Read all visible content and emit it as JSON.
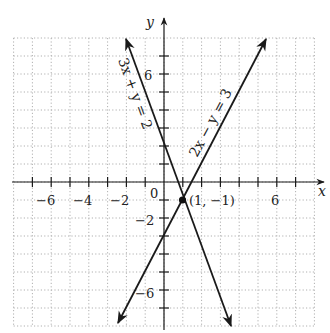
{
  "chart_data": {
    "type": "line",
    "title": "",
    "xlabel": "x",
    "ylabel": "y",
    "xlim": [
      -8,
      8
    ],
    "ylim": [
      -8,
      8
    ],
    "grid": true,
    "grid_style": "dotted",
    "x_ticks": [
      -6,
      -4,
      -2,
      0,
      2,
      4,
      6
    ],
    "x_tick_labels": [
      "−6",
      "−4",
      "−2",
      "0",
      "6"
    ],
    "y_tick_labels": [
      "6",
      "−2",
      "−6"
    ],
    "origin_label": "0",
    "series": [
      {
        "name": "3x + y = 2",
        "equation": "y = 2 - 3x",
        "x": [
          -2,
          3.27
        ],
        "y": [
          8,
          -7.8
        ]
      },
      {
        "name": "2x − y = 3",
        "equation": "y = 2x - 3",
        "x": [
          -2.4,
          5.5
        ],
        "y": [
          -7.8,
          8
        ]
      }
    ],
    "annotations": [
      {
        "text": "(1, −1)",
        "point": [
          1,
          -1
        ],
        "type": "intersection"
      }
    ]
  },
  "labels": {
    "x_axis": "x",
    "y_axis": "y",
    "origin": "0",
    "line1": "3x + y = 2",
    "line2": "2x − y = 3",
    "intersection": "(1, −1)",
    "xt_m6": "−6",
    "xt_m4": "−4",
    "xt_m2": "−2",
    "xt_6": "6",
    "yt_6": "6",
    "yt_m2": "−2",
    "yt_m6": "−6"
  },
  "colors": {
    "line": "#1a1a1a",
    "grid": "#b0b0b0"
  }
}
